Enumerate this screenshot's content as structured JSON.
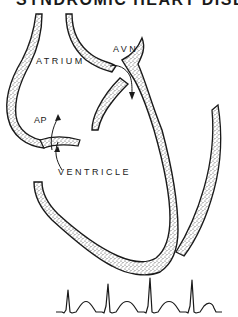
{
  "title": "SYNDROMIC HEART DISEASE",
  "labels": {
    "avn": "AVN",
    "atrium": "ATRIUM",
    "ap": "AP",
    "ventricle": "VENTRICLE"
  },
  "colors": {
    "ink": "#1a1a1a",
    "stipple": "#555555",
    "background": "#ffffff"
  },
  "ecg": {
    "beats": 5,
    "description": "Rhythm strip with narrow QRS complexes and T waves"
  }
}
